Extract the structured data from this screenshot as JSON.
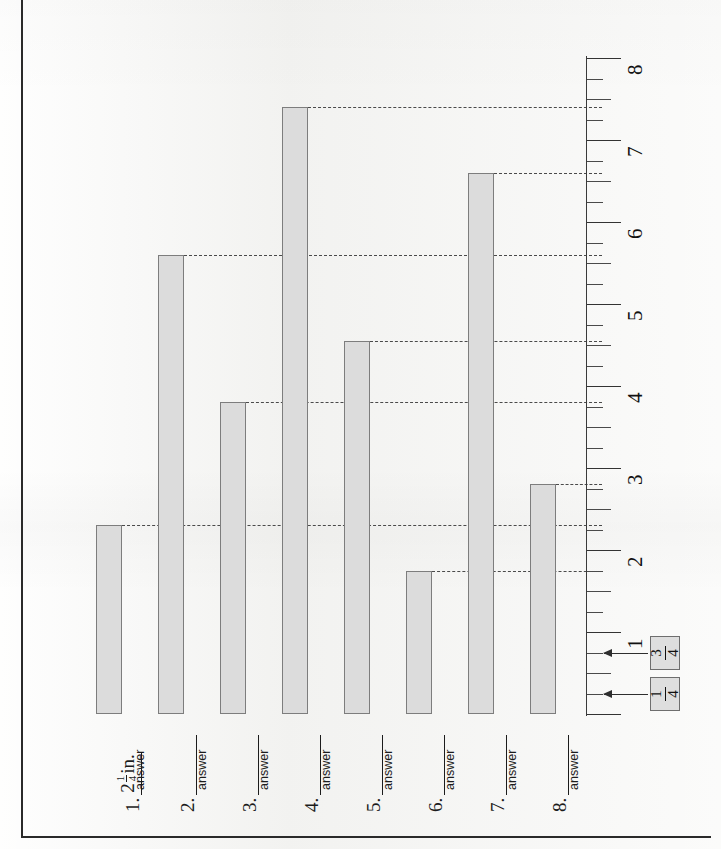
{
  "worksheet": {
    "ruler_unit": "in.",
    "answer_word": "answer"
  },
  "chart_data": {
    "type": "bar",
    "title": "",
    "xlabel": "",
    "ylabel": "inches",
    "orientation": "vertical-bars-with-ruler-axis",
    "axis_range": [
      0,
      8
    ],
    "tick_major": 1,
    "tick_minor": 0.25,
    "grid": false,
    "categories": [
      "1.",
      "2.",
      "3.",
      "4.",
      "5.",
      "6.",
      "7.",
      "8."
    ],
    "values": [
      2.3,
      5.6,
      3.8,
      7.4,
      4.55,
      1.75,
      6.6,
      2.8
    ],
    "tick_labels": [
      "1",
      "2",
      "3",
      "4",
      "5",
      "6",
      "7",
      "8"
    ],
    "annotations": [
      "3/4",
      "1/4"
    ]
  },
  "ruler": {
    "numbers": [
      {
        "label": "1",
        "value": 1
      },
      {
        "label": "2",
        "value": 2
      },
      {
        "label": "3",
        "value": 3
      },
      {
        "label": "4",
        "value": 4
      },
      {
        "label": "5",
        "value": 5
      },
      {
        "label": "6",
        "value": 6
      },
      {
        "label": "7",
        "value": 7
      },
      {
        "label": "8",
        "value": 8
      }
    ]
  },
  "callouts": [
    {
      "id": "three-quarters",
      "numerator": "3",
      "denominator": "4",
      "points_to": 0.75
    },
    {
      "id": "one-quarter",
      "numerator": "1",
      "denominator": "4",
      "points_to": 0.25
    }
  ],
  "items": [
    {
      "number": "1.",
      "whole": "2",
      "numerator": "1",
      "denominator": "4",
      "unit": "in.",
      "filled": true,
      "answer_label": "answer",
      "bar_value": 2.3
    },
    {
      "number": "2.",
      "whole": "",
      "numerator": "",
      "denominator": "",
      "unit": "",
      "filled": false,
      "answer_label": "answer",
      "bar_value": 5.6
    },
    {
      "number": "3.",
      "whole": "",
      "numerator": "",
      "denominator": "",
      "unit": "",
      "filled": false,
      "answer_label": "answer",
      "bar_value": 3.8
    },
    {
      "number": "4.",
      "whole": "",
      "numerator": "",
      "denominator": "",
      "unit": "",
      "filled": false,
      "answer_label": "answer",
      "bar_value": 7.4
    },
    {
      "number": "5.",
      "whole": "",
      "numerator": "",
      "denominator": "",
      "unit": "",
      "filled": false,
      "answer_label": "answer",
      "bar_value": 4.55
    },
    {
      "number": "6.",
      "whole": "",
      "numerator": "",
      "denominator": "",
      "unit": "",
      "filled": false,
      "answer_label": "answer",
      "bar_value": 1.75
    },
    {
      "number": "7.",
      "whole": "",
      "numerator": "",
      "denominator": "",
      "unit": "",
      "filled": false,
      "answer_label": "answer",
      "bar_value": 6.6
    },
    {
      "number": "8.",
      "whole": "",
      "numerator": "",
      "denominator": "",
      "unit": "",
      "filled": false,
      "answer_label": "answer",
      "bar_value": 2.8
    }
  ],
  "colors": {
    "bar_fill": "#dcdcdc",
    "bar_stroke": "#7d7d7d",
    "ink": "#1c1c1c",
    "paper": "#f5f5f3",
    "callout_fill": "#dedede"
  }
}
